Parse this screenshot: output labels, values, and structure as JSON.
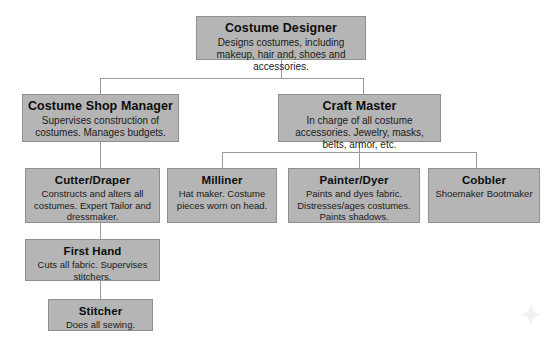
{
  "diagram": {
    "box_fill": "#b5b5b5",
    "box_border": "#8f8f8f",
    "line_color": "#9a9a9a",
    "background": "#ffffff"
  },
  "nodes": {
    "costume_designer": {
      "title": "Costume Designer",
      "desc": "Designs costumes, including makeup, hair and, shoes and accessories."
    },
    "costume_shop_manager": {
      "title": "Costume Shop Manager",
      "desc": "Supervises construction of costumes. Manages budgets."
    },
    "craft_master": {
      "title": "Craft Master",
      "desc": "In charge of all costume accessories. Jewelry, masks, belts, armor, etc."
    },
    "cutter_draper": {
      "title": "Cutter/Draper",
      "desc": "Constructs and alters all costumes. Expert Tailor and dressmaker."
    },
    "milliner": {
      "title": "Milliner",
      "desc": "Hat maker. Costume pieces worn on head."
    },
    "painter_dyer": {
      "title": "Painter/Dyer",
      "desc": "Paints and dyes fabric. Distresses/ages costumes. Paints shadows."
    },
    "cobbler": {
      "title": "Cobbler",
      "desc": "Shoemaker Bootmaker"
    },
    "first_hand": {
      "title": "First Hand",
      "desc": "Cuts all fabric. Supervises stitchers."
    },
    "stitcher": {
      "title": "Stitcher",
      "desc": "Does all sewing."
    }
  }
}
